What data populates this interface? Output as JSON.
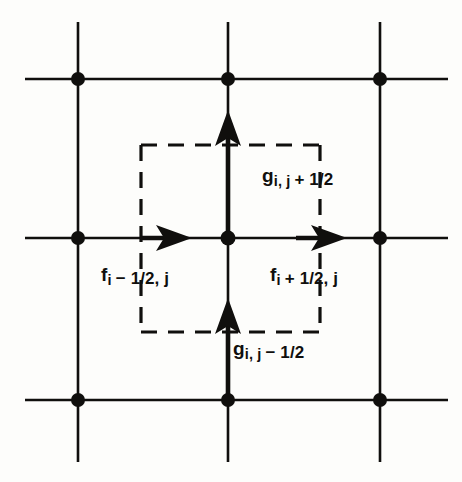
{
  "figure": {
    "name": "staggered-grid-flux-control-volume",
    "background_color": "#fdfdfb",
    "ink_color": "#100f0d"
  },
  "grid": {
    "columns_x": [
      78,
      228,
      380
    ],
    "rows_y": [
      79,
      238,
      400
    ],
    "h_line_start_x": 25,
    "h_line_end_x": 448,
    "v_line_start_y": 22,
    "v_line_end_y": 462,
    "line_width": 2.6,
    "node_radius": 7,
    "node_count": 9
  },
  "control_volume": {
    "left": 141,
    "right": 320,
    "top": 145,
    "bottom": 332,
    "style": "dashed",
    "dash_pattern": "16 11",
    "line_width": 3.2
  },
  "arrows": [
    {
      "id": "g-top",
      "direction": "up",
      "x": 228,
      "tail_y": 238,
      "tip_y": 112,
      "label": "g_{i, j + 1/2}"
    },
    {
      "id": "g-bottom",
      "direction": "up",
      "x": 228,
      "tail_y": 400,
      "tip_y": 300,
      "label": "g_{i, j - 1/2}"
    },
    {
      "id": "f-left",
      "direction": "right",
      "y": 238,
      "tail_x": 141,
      "tip_x": 192,
      "label": "f_{i - 1/2, j}"
    },
    {
      "id": "f-right",
      "direction": "right",
      "y": 238,
      "tail_x": 296,
      "tip_x": 347,
      "label": "f_{i + 1/2, j}"
    }
  ],
  "labels": {
    "g_top": {
      "symbol": "g",
      "subscript_prefix": "i, j ",
      "sign": "+",
      "fraction": " 1/2",
      "full": "gi, j + 1/2"
    },
    "g_bottom": {
      "symbol": "g",
      "subscript_prefix": "i, j ",
      "sign": "−",
      "fraction": " 1/2",
      "full": "gi, j − 1/2"
    },
    "f_left": {
      "symbol": "f",
      "subscript_prefix": "i ",
      "sign": "−",
      "fraction": " 1/2, j",
      "full": "fi − 1/2, j"
    },
    "f_right": {
      "symbol": "f",
      "subscript_prefix": "i ",
      "sign": "+",
      "fraction": " 1/2, j",
      "full": "fi + 1/2, j"
    }
  }
}
